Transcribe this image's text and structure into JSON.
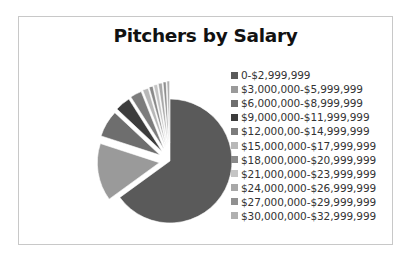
{
  "chart_data": {
    "type": "pie",
    "title": "Pitchers by Salary",
    "exploded": true,
    "legend_position": "right",
    "categories": [
      "0-$2,999,999",
      "$3,000,000-$5,999,999",
      "$6,000,000-$8,999,999",
      "$9,000,000-$11,999,999",
      "$12,000,00-$14,999,999",
      "$15,000,000-$17,999,999",
      "$18,000,000-$20,999,999",
      "$21,000,000-$23,999,999",
      "$24,000,000-$26,999,999",
      "$27,000,000-$29,999,999",
      "$30,000,000-$32,999,999"
    ],
    "values": [
      65,
      15,
      7,
      4,
      3,
      1.5,
      1,
      1,
      1,
      0.8,
      0.7
    ],
    "colors": [
      "#5a5a5a",
      "#9a9a9a",
      "#6e6e6e",
      "#3c3c3c",
      "#7c7c7c",
      "#b8b8b8",
      "#8a8a8a",
      "#c4c4c4",
      "#a8a8a8",
      "#909090",
      "#b0b0b0"
    ]
  }
}
